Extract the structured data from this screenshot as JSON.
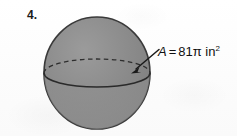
{
  "page": {
    "background_color": "#fdfdfd",
    "width": 237,
    "height": 136
  },
  "problem": {
    "number_label": "4."
  },
  "figure": {
    "shape_name": "sphere",
    "fill_color": "#8d8d8d",
    "outline_color": "#3a3a3a",
    "equator_back_style": "dashed",
    "equator_front_style": "solid",
    "center_x": 97,
    "center_y": 73,
    "radius_x": 53,
    "radius_y": 56,
    "equator_radius_y": 14
  },
  "annotation": {
    "label_variable": "A",
    "label_equals": "=",
    "label_value": "81",
    "label_pi": "π",
    "label_units": "in",
    "label_exponent": "2",
    "full_text": "A = 81π in2",
    "arrow_name": "leader-arrow",
    "arrow_color": "#1a1a1a",
    "arrow_tail_x": 159,
    "arrow_tail_y": 50,
    "arrow_tip_x": 132,
    "arrow_tip_y": 73
  }
}
